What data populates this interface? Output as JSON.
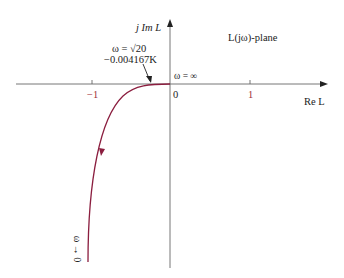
{
  "diagram": {
    "title": "L(jω)-plane",
    "axes": {
      "y_label": "j Im L",
      "x_label": "Re L",
      "x_ticks": [
        "−1",
        "0",
        "1"
      ]
    },
    "annotations": {
      "crossing_line1": "ω = √20",
      "crossing_line2": "−0.004167K",
      "origin": "ω = ∞",
      "start": "ω → 0"
    },
    "colors": {
      "curve": "#8b1e3f",
      "axis": "#555555",
      "tick_label": "#a0303a"
    }
  }
}
